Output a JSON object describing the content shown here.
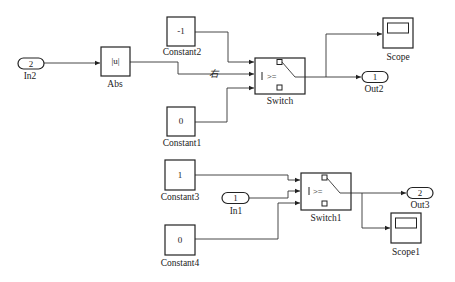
{
  "diagram": {
    "blocks": {
      "in2": {
        "label": "In2",
        "value": "2"
      },
      "abs": {
        "label": "Abs",
        "value": "|u|"
      },
      "constant2": {
        "label": "Constant2",
        "value": "-1"
      },
      "constant1": {
        "label": "Constant1",
        "value": "0"
      },
      "switch": {
        "label": "Switch",
        "criteria": ">="
      },
      "scope": {
        "label": "Scope"
      },
      "out2": {
        "label": "Out2",
        "value": "1"
      },
      "constant3": {
        "label": "Constant3",
        "value": "1"
      },
      "in1": {
        "label": "In1",
        "value": "1"
      },
      "constant4": {
        "label": "Constant4",
        "value": "0"
      },
      "switch1": {
        "label": "Switch1",
        "criteria": ">="
      },
      "out3": {
        "label": "Out3",
        "value": "2"
      },
      "scope1": {
        "label": "Scope1"
      }
    },
    "signal_label": "右"
  }
}
